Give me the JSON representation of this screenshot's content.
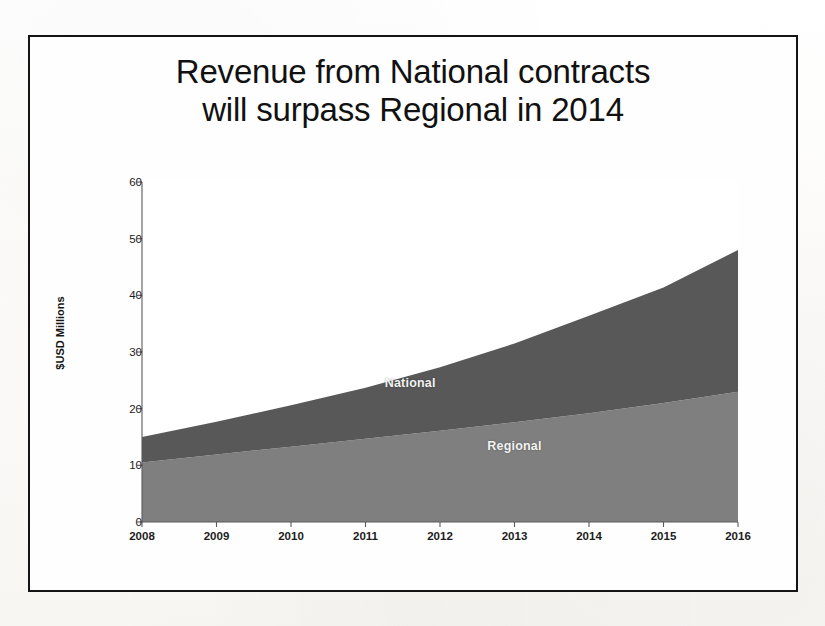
{
  "slide": {
    "title_line1": "Revenue from National contracts",
    "title_line2": "will surpass Regional in 2014",
    "border_color": "#141414",
    "background_color": "#fefefe"
  },
  "chart_data": {
    "type": "area",
    "stacked": true,
    "title": "Revenue from National contracts will surpass Regional in 2014",
    "xlabel": "",
    "ylabel": "$USD Millions",
    "categories": [
      "2008",
      "2009",
      "2010",
      "2011",
      "2012",
      "2013",
      "2014",
      "2015",
      "2016"
    ],
    "x": [
      2008,
      2009,
      2010,
      2011,
      2012,
      2013,
      2014,
      2015,
      2016
    ],
    "ylim": [
      0,
      60
    ],
    "yticks": [
      0,
      10,
      20,
      30,
      40,
      50,
      60
    ],
    "ytick_labels": [
      "0",
      "10",
      "20",
      "30",
      "40",
      "50",
      "60"
    ],
    "grid": false,
    "legend": "inline-labels",
    "series": [
      {
        "name": "Regional",
        "color": "#7f7f7f",
        "values": [
          10.5,
          11.9,
          13.3,
          14.7,
          16.1,
          17.6,
          19.2,
          21.0,
          23.0
        ],
        "label_x": 2013,
        "label_y": 13.5
      },
      {
        "name": "National",
        "color": "#585858",
        "values": [
          4.5,
          5.8,
          7.3,
          9.0,
          11.2,
          13.9,
          17.2,
          20.4,
          25.0
        ],
        "label_x": 2011.6,
        "label_y": 24.5
      }
    ],
    "totals": [
      15.0,
      17.7,
      20.6,
      23.7,
      27.3,
      31.5,
      36.4,
      41.4,
      48.0
    ],
    "crossover_note": "National surpasses Regional in 2014",
    "annotations": [
      {
        "text": "National",
        "series": "National"
      },
      {
        "text": "Regional",
        "series": "Regional"
      }
    ]
  }
}
